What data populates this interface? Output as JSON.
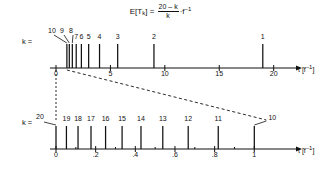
{
  "figure": {
    "formula": {
      "lhs": "E[T",
      "lhs_sub": "k",
      "lhs_close": "] =",
      "numerator": "20 – k",
      "denominator": "k",
      "rhs_dot": "·",
      "rhs_base": "f",
      "rhs_exp": "–1"
    },
    "upper_axis": {
      "k_label": "k =",
      "axis_title": "t [f",
      "axis_title_exp": "–1",
      "axis_title_close": "]",
      "tick_labels": [
        "0",
        "5",
        "10",
        "15",
        "20"
      ],
      "tick_values": [
        0,
        5,
        10,
        15,
        20
      ],
      "range": [
        0,
        21.5
      ],
      "stems": [
        {
          "k": "1",
          "t": 19.0
        },
        {
          "k": "2",
          "t": 9.0
        },
        {
          "k": "3",
          "t": 5.667
        },
        {
          "k": "4",
          "t": 4.0
        },
        {
          "k": "5",
          "t": 3.0
        },
        {
          "k": "6",
          "t": 2.333
        },
        {
          "k": "7",
          "t": 1.857
        },
        {
          "k": "8",
          "t": 1.5
        },
        {
          "k": "9",
          "t": 1.222
        },
        {
          "k": "10",
          "t": 1.0
        }
      ],
      "leader_labels": [
        "10",
        "9",
        "8"
      ]
    },
    "lower_axis": {
      "k_label": "k =",
      "axis_title": "t [f",
      "axis_title_exp": "–1",
      "axis_title_close": "]",
      "tick_labels": [
        "0",
        ".2",
        ".4",
        ".6",
        ".8",
        "1"
      ],
      "tick_values": [
        0,
        0.2,
        0.4,
        0.6,
        0.8,
        1.0
      ],
      "minor_tick_values": [
        0.1,
        0.3,
        0.5,
        0.7,
        0.9
      ],
      "range": [
        0,
        1.18
      ],
      "stems": [
        {
          "k": "20",
          "t": 0.0
        },
        {
          "k": "19",
          "t": 0.0526
        },
        {
          "k": "18",
          "t": 0.1111
        },
        {
          "k": "17",
          "t": 0.1765
        },
        {
          "k": "16",
          "t": 0.25
        },
        {
          "k": "15",
          "t": 0.3333
        },
        {
          "k": "14",
          "t": 0.4286
        },
        {
          "k": "13",
          "t": 0.5385
        },
        {
          "k": "12",
          "t": 0.6667
        },
        {
          "k": "11",
          "t": 0.8182
        },
        {
          "k": "10",
          "t": 1.0
        }
      ]
    },
    "connectors": {
      "description": "dashed zoom guides from upper axis origin-region to lower axis",
      "vertical_at": "0",
      "diagonal_from": "1.0",
      "diagonal_to": "1"
    },
    "colors": {
      "ink": "#111111",
      "background": "#ffffff"
    }
  }
}
